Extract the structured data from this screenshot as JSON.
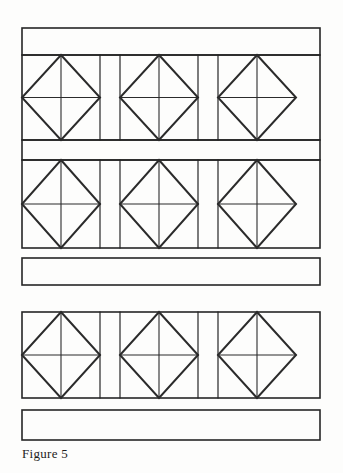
{
  "figure": {
    "caption": "Figure 5",
    "background_color": "#fdfdfc",
    "line_color": "#262626",
    "diamond_line_color": "#2b2b2b",
    "canvas": {
      "width": 343,
      "height": 473
    },
    "geometry": {
      "left": 22,
      "right": 320,
      "cell_widths": [
        78,
        20,
        78,
        20,
        78
      ],
      "frame_stroke": 1.6,
      "divider_stroke": 1.2,
      "diamond_stroke": 2.0,
      "center_line_stroke": 1.1
    },
    "bands": [
      {
        "name": "top-band",
        "label": "Top plain band",
        "x": 22,
        "y": 28,
        "width": 298,
        "height": 27,
        "filled": false,
        "attached_below": true
      },
      {
        "name": "mid-band",
        "label": "Middle plain band",
        "x": 22,
        "y": 140,
        "width": 298,
        "height": 20,
        "filled": false,
        "attached_below": true
      },
      {
        "name": "free-band",
        "label": "Free plain band",
        "x": 22,
        "y": 258,
        "width": 298,
        "height": 27,
        "filled": false,
        "attached_below": false
      },
      {
        "name": "bottom-band",
        "label": "Bottom plain band",
        "x": 22,
        "y": 410,
        "width": 298,
        "height": 30,
        "filled": false,
        "attached_below": false
      }
    ],
    "panel_rows": [
      {
        "name": "panel-row-1",
        "label": "Upper diamond panel row",
        "y": 55,
        "height": 85,
        "cells": [
          {
            "type": "diamond",
            "label": "braced panel"
          },
          {
            "type": "spacer",
            "label": "plain panel"
          },
          {
            "type": "diamond",
            "label": "braced panel"
          },
          {
            "type": "spacer",
            "label": "plain panel"
          },
          {
            "type": "diamond",
            "label": "braced panel"
          }
        ]
      },
      {
        "name": "panel-row-2",
        "label": "Middle diamond panel row",
        "y": 160,
        "height": 88,
        "cells": [
          {
            "type": "diamond",
            "label": "braced panel"
          },
          {
            "type": "spacer",
            "label": "plain panel"
          },
          {
            "type": "diamond",
            "label": "braced panel"
          },
          {
            "type": "spacer",
            "label": "plain panel"
          },
          {
            "type": "diamond",
            "label": "braced panel"
          }
        ]
      },
      {
        "name": "panel-row-3",
        "label": "Lower diamond panel row",
        "y": 312,
        "height": 86,
        "cells": [
          {
            "type": "diamond",
            "label": "braced panel"
          },
          {
            "type": "spacer",
            "label": "plain panel"
          },
          {
            "type": "diamond",
            "label": "braced panel"
          },
          {
            "type": "spacer",
            "label": "plain panel"
          },
          {
            "type": "diamond",
            "label": "braced panel"
          }
        ]
      }
    ]
  }
}
